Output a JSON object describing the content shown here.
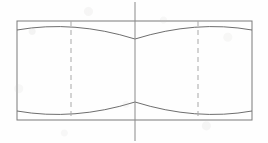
{
  "figure": {
    "background_color": "#fefefe"
  },
  "styles": {
    "outline_color": "#7a7a7a",
    "arc_color": "#6e6e6e",
    "hidden_line_color": "#a8a8a8",
    "center_line_color": "#8a8a8a",
    "outline_width": 1.0,
    "arc_width": 1.0,
    "hidden_line_width": 1.0,
    "center_line_width": 1.0,
    "hidden_dash_pattern": "5,4",
    "center_dash_pattern": "none"
  },
  "geometry": {
    "body_rect": {
      "x": 17,
      "y": 21,
      "width": 235,
      "height": 99,
      "right": 252,
      "bottom": 120
    },
    "center_line": {
      "x": 135,
      "y_top": 2,
      "y_bottom": 141
    },
    "hidden_lines": [
      {
        "name": "left-hidden-edge",
        "x": 71,
        "y_top": 21,
        "y_bottom": 120
      },
      {
        "name": "right-hidden-edge",
        "x": 198,
        "y_top": 21,
        "y_bottom": 120
      }
    ],
    "chamfer_vertices": {
      "top_center": {
        "x": 135,
        "y": 39
      },
      "bottom_center": {
        "x": 135,
        "y": 102
      }
    },
    "arcs": [
      {
        "name": "top-left-chamfer-arc",
        "start": {
          "x": 17,
          "y": 30
        },
        "end": {
          "x": 135,
          "y": 39
        },
        "control": {
          "x": 74,
          "y": 20
        }
      },
      {
        "name": "top-right-chamfer-arc",
        "start": {
          "x": 135,
          "y": 39
        },
        "end": {
          "x": 252,
          "y": 30
        },
        "control": {
          "x": 196,
          "y": 20
        }
      },
      {
        "name": "bottom-left-chamfer-arc",
        "start": {
          "x": 17,
          "y": 111
        },
        "end": {
          "x": 135,
          "y": 102
        },
        "control": {
          "x": 74,
          "y": 121
        }
      },
      {
        "name": "bottom-right-chamfer-arc",
        "start": {
          "x": 135,
          "y": 102
        },
        "end": {
          "x": 252,
          "y": 111
        },
        "control": {
          "x": 196,
          "y": 121
        }
      }
    ]
  }
}
